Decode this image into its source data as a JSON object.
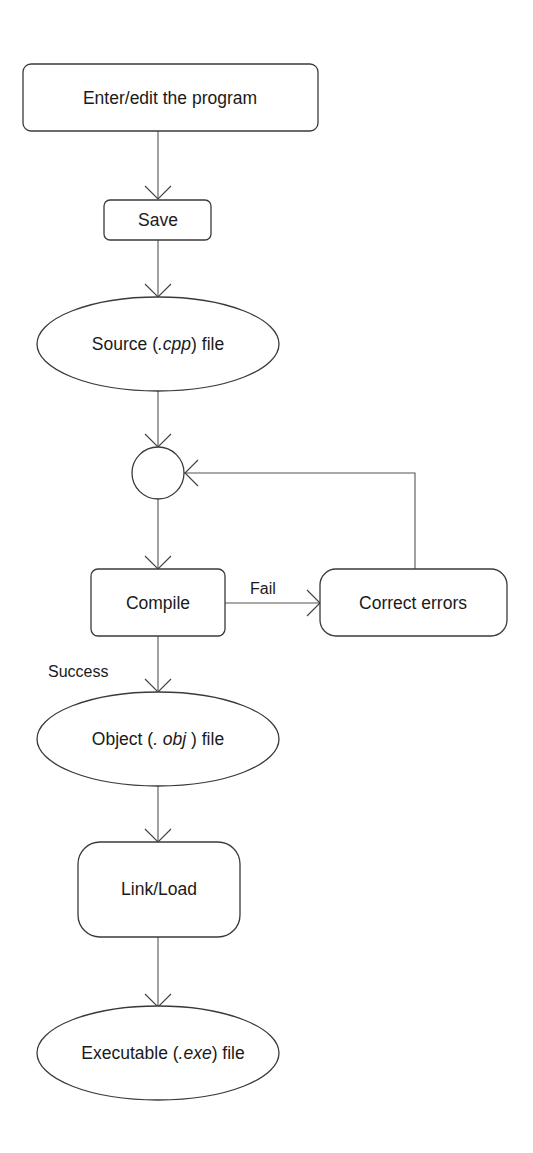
{
  "diagram": {
    "type": "flowchart",
    "title": "",
    "nodes": {
      "enter_edit": {
        "label": "Enter/edit the program",
        "shape": "rounded-rectangle"
      },
      "save": {
        "label": "Save",
        "shape": "rounded-rectangle"
      },
      "source_file": {
        "prefix": "Source (",
        "ext": ".cpp",
        "suffix": ") file",
        "shape": "ellipse"
      },
      "junction": {
        "label": "",
        "shape": "circle"
      },
      "compile": {
        "label": "Compile",
        "shape": "rounded-rectangle"
      },
      "correct_errors": {
        "label": "Correct errors",
        "shape": "rounded-rectangle"
      },
      "object_file": {
        "prefix": "Object (",
        "ext": ". obj",
        "suffix": " ) file",
        "shape": "ellipse"
      },
      "link_load": {
        "label": "Link/Load",
        "shape": "rounded-rectangle"
      },
      "executable_file": {
        "prefix": "Executable (",
        "ext": ".exe",
        "suffix": ") file",
        "shape": "ellipse"
      }
    },
    "edges": [
      {
        "from": "enter_edit",
        "to": "save",
        "label": ""
      },
      {
        "from": "save",
        "to": "source_file",
        "label": ""
      },
      {
        "from": "source_file",
        "to": "junction",
        "label": ""
      },
      {
        "from": "junction",
        "to": "compile",
        "label": ""
      },
      {
        "from": "compile",
        "to": "correct_errors",
        "label": "Fail"
      },
      {
        "from": "correct_errors",
        "to": "junction",
        "label": ""
      },
      {
        "from": "compile",
        "to": "object_file",
        "label": "Success"
      },
      {
        "from": "object_file",
        "to": "link_load",
        "label": ""
      },
      {
        "from": "link_load",
        "to": "executable_file",
        "label": ""
      }
    ],
    "edge_labels": {
      "fail": "Fail",
      "success": "Success"
    }
  }
}
